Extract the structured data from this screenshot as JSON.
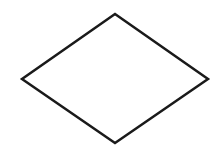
{
  "diagram": {
    "shape": "decision-diamond",
    "label": "",
    "vertices": {
      "top": [
        115,
        14
      ],
      "right": [
        208,
        79
      ],
      "bottom": [
        115,
        143
      ],
      "left": [
        22,
        79
      ]
    },
    "stroke_color": "#1a1a1a",
    "fill_color": "#ffffff",
    "stroke_width": 2.5,
    "background_color": "#ffffff"
  }
}
